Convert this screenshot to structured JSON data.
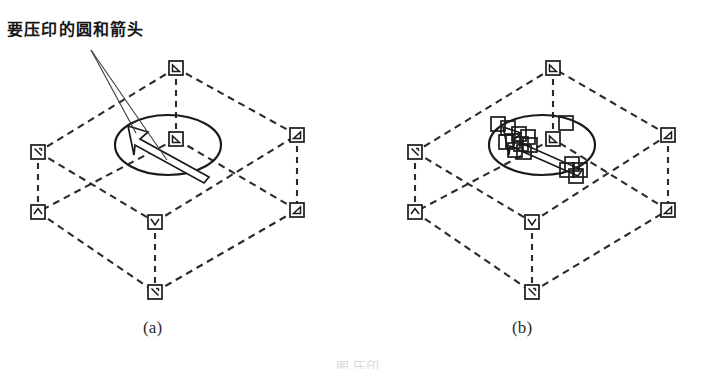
{
  "figure": {
    "annotation_label": "要压印的圆和箭头",
    "caption": "图 压印",
    "panels": [
      {
        "id": "a",
        "label": "(a)",
        "description": "待压印的立方体线框、椭圆与箭头"
      },
      {
        "id": "b",
        "label": "(b)",
        "description": "压印后在椭圆与箭头上生成的节点"
      }
    ],
    "colors": {
      "background": "#ffffff",
      "line": "#2b2b2b",
      "marker_stroke": "#1a1a1a",
      "marker_fill": "#ffffff",
      "leader_line": "#3a3a3a",
      "text": "#161616"
    },
    "geometry": {
      "panel_a": {
        "top_face": [
          [
            176,
            68
          ],
          [
            38,
            152
          ],
          [
            155,
            222
          ],
          [
            297,
            135
          ]
        ],
        "bottom_face": [
          [
            176,
            139
          ],
          [
            38,
            212
          ],
          [
            155,
            292
          ],
          [
            297,
            210
          ]
        ],
        "verticals": [
          [
            [
              176,
              68
            ],
            [
              176,
              139
            ]
          ],
          [
            [
              38,
              152
            ],
            [
              38,
              212
            ]
          ],
          [
            [
              155,
              222
            ],
            [
              155,
              292
            ]
          ],
          [
            [
              297,
              135
            ],
            [
              297,
              210
            ]
          ]
        ],
        "ellipse": {
          "cx": 168,
          "cy": 145,
          "rx": 53,
          "ry": 30
        },
        "arrow": {
          "tail": [
            205,
            177
          ],
          "head": [
            130,
            127
          ]
        },
        "leader_origin": [
          91,
          50
        ],
        "leader_targets": [
          [
            135,
            132
          ],
          [
            165,
            160
          ]
        ]
      },
      "panel_b": {
        "top_face": [
          [
            553,
            68
          ],
          [
            415,
            152
          ],
          [
            532,
            222
          ],
          [
            668,
            135
          ]
        ],
        "bottom_face": [
          [
            553,
            139
          ],
          [
            415,
            212
          ],
          [
            532,
            292
          ],
          [
            668,
            210
          ]
        ],
        "verticals": [
          [
            [
              553,
              68
            ],
            [
              553,
              139
            ]
          ],
          [
            [
              415,
              152
            ],
            [
              415,
              212
            ]
          ],
          [
            [
              532,
              222
            ],
            [
              532,
              292
            ]
          ],
          [
            [
              668,
              135
            ],
            [
              668,
              210
            ]
          ]
        ],
        "ellipse": {
          "cx": 542,
          "cy": 145,
          "rx": 53,
          "ry": 30
        },
        "arrow": {
          "tail": [
            578,
            166
          ],
          "head": [
            505,
            128
          ]
        },
        "imprint_marker_count": 16
      },
      "marker_size": 14,
      "dash_pattern": "7 5"
    }
  }
}
